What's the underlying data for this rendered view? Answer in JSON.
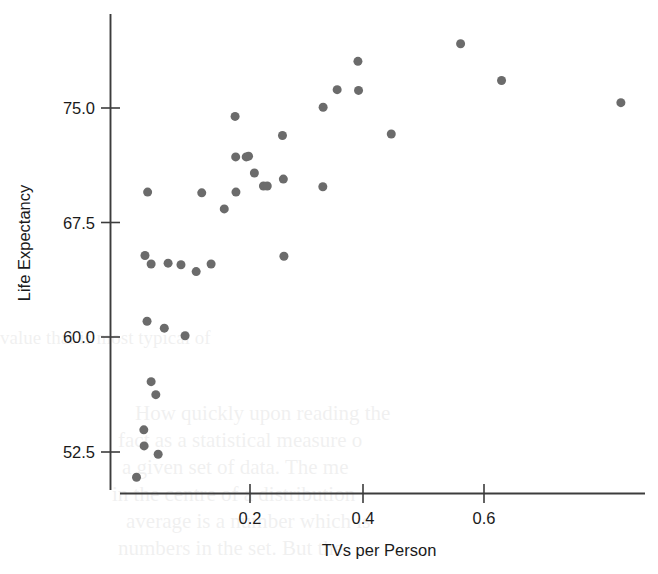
{
  "chart_data": {
    "type": "scatter",
    "title": "",
    "xlabel": "TVs per Person",
    "ylabel": "Life Expectancy",
    "xlim": [
      -0.023,
      0.876
    ],
    "ylim": [
      50.2,
      80.4
    ],
    "xticks": [
      0.2,
      0.4,
      0.6
    ],
    "xtick_labels": [
      "0.2",
      "0.4",
      "0.6"
    ],
    "yticks": [
      52.5,
      60.0,
      67.5,
      75.0
    ],
    "ytick_labels": [
      "52.5",
      "60.0",
      "67.5",
      "75.0"
    ],
    "grid": false,
    "legend": null,
    "marker": {
      "shape": "circle",
      "color": "#6b6b6b",
      "size_px": 9
    },
    "n_points": 38,
    "points": [
      {
        "x": 0.006,
        "y": 50.85
      },
      {
        "x": 0.019,
        "y": 52.9
      },
      {
        "x": 0.0185,
        "y": 53.95
      },
      {
        "x": 0.043,
        "y": 52.35
      },
      {
        "x": 0.039,
        "y": 56.25
      },
      {
        "x": 0.031,
        "y": 57.1
      },
      {
        "x": 0.0535,
        "y": 60.6
      },
      {
        "x": 0.024,
        "y": 61.05
      },
      {
        "x": 0.089,
        "y": 60.1
      },
      {
        "x": 0.06,
        "y": 64.85
      },
      {
        "x": 0.0205,
        "y": 65.35
      },
      {
        "x": 0.031,
        "y": 64.8
      },
      {
        "x": 0.082,
        "y": 64.75
      },
      {
        "x": 0.108,
        "y": 64.3
      },
      {
        "x": 0.1335,
        "y": 64.8
      },
      {
        "x": 0.025,
        "y": 69.5
      },
      {
        "x": 0.156,
        "y": 68.4
      },
      {
        "x": 0.1175,
        "y": 69.45
      },
      {
        "x": 0.176,
        "y": 69.5
      },
      {
        "x": 0.1755,
        "y": 71.8
      },
      {
        "x": 0.1935,
        "y": 71.8
      },
      {
        "x": 0.1745,
        "y": 74.45
      },
      {
        "x": 0.2075,
        "y": 70.75
      },
      {
        "x": 0.223,
        "y": 69.9
      },
      {
        "x": 0.2295,
        "y": 69.9
      },
      {
        "x": 0.258,
        "y": 65.3
      },
      {
        "x": 0.257,
        "y": 70.35
      },
      {
        "x": 0.2555,
        "y": 73.2
      },
      {
        "x": 0.325,
        "y": 75.05
      },
      {
        "x": 0.3245,
        "y": 69.85
      },
      {
        "x": 0.349,
        "y": 76.2
      },
      {
        "x": 0.3855,
        "y": 76.15
      },
      {
        "x": 0.3845,
        "y": 78.05
      },
      {
        "x": 0.4415,
        "y": 73.3
      },
      {
        "x": 0.56,
        "y": 79.2
      },
      {
        "x": 0.63,
        "y": 76.8
      },
      {
        "x": 0.834,
        "y": 75.35
      },
      {
        "x": 0.1975,
        "y": 71.85
      }
    ]
  },
  "background_bleed": {
    "visible": true,
    "note": "faint show-through text from reverse of scanned page",
    "lines": [
      "How quickly upon reading the",
      "fact as a statistical measure o",
      "a given set of data. The me",
      "in the centre of a distribution",
      "average is a number which is",
      "numbers in the set. But the",
      "value that is most typical of"
    ]
  }
}
